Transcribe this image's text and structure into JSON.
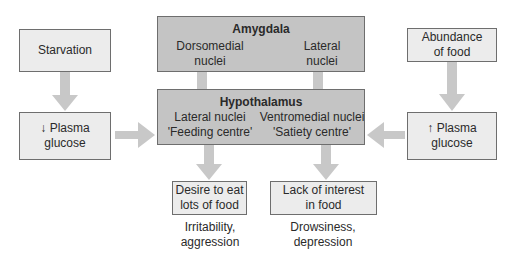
{
  "diagram": {
    "left": {
      "top_box": "Starvation",
      "bottom_box_line1": "↓ Plasma",
      "bottom_box_line2": "glucose"
    },
    "right": {
      "top_box_line1": "Abundance",
      "top_box_line2": "of food",
      "bottom_box_line1": "↑ Plasma",
      "bottom_box_line2": "glucose"
    },
    "amygdala": {
      "title": "Amygdala",
      "left_line1": "Dorsomedial",
      "left_line2": "nuclei",
      "right_line1": "Lateral",
      "right_line2": "nuclei"
    },
    "hypothalamus": {
      "title": "Hypothalamus",
      "left_line1": "Lateral nuclei",
      "left_line2": "'Feeding centre'",
      "right_line1": "Ventromedial nuclei",
      "right_line2": "'Satiety centre'"
    },
    "outcomes": {
      "left_box_line1": "Desire to eat",
      "left_box_line2": "lots of food",
      "left_caption_line1": "Irritability,",
      "left_caption_line2": "aggression",
      "right_box_line1": "Lack of interest",
      "right_box_line2": "in food",
      "right_caption_line1": "Drowsiness,",
      "right_caption_line2": "depression"
    },
    "colors": {
      "light_box": "#ececec",
      "dark_box": "#c4c4c4",
      "arrow": "#c8c8c8",
      "border": "#6e6e6e"
    }
  }
}
